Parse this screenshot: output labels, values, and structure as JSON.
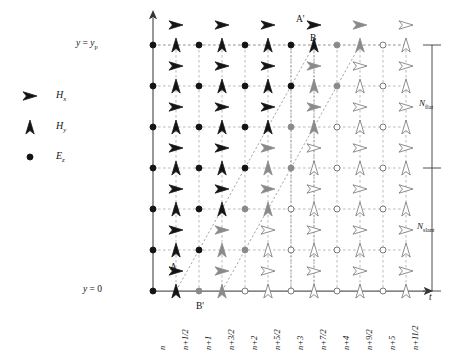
{
  "figure": {
    "axis_y_label": "y",
    "axis_t_label": "t",
    "y_top_label": "y = yₚ",
    "y_top_label_parts": {
      "lhs": "y",
      "eq": "=",
      "rhs": "y",
      "rhs_sub": "p"
    },
    "y_bottom_label": "y = 0",
    "y_bottom_label_parts": {
      "lhs": "y",
      "eq": "=",
      "rhs": "0"
    }
  },
  "legend": {
    "items": [
      {
        "symbol": "right-arrow-black",
        "label": "H",
        "sub": "x",
        "script": true
      },
      {
        "symbol": "up-arrow-black",
        "label": "H",
        "sub": "y",
        "script": true
      },
      {
        "symbol": "filled-dot-black",
        "label": "E",
        "sub": "z",
        "script": true
      }
    ]
  },
  "brackets": {
    "flat": {
      "label": "N",
      "sub": "flat"
    },
    "slant": {
      "label": "N",
      "sub": "slant"
    }
  },
  "point_labels": [
    {
      "name": "A",
      "x": 170,
      "y": 262
    },
    {
      "name": "A'",
      "x": 296,
      "y": 14
    },
    {
      "name": "B",
      "x": 310,
      "y": 33
    },
    {
      "name": "B'",
      "x": 196,
      "y": 301
    }
  ],
  "x_tick_labels": [
    "n",
    "n+1/2",
    "n+1",
    "n+3/2",
    "n+2",
    "n+5/2",
    "n+3",
    "n+7/2",
    "n+4",
    "n+9/2",
    "n+5",
    "n+11/2"
  ],
  "chart_data": {
    "type": "scatter",
    "xlabel": "t",
    "ylabel": "y",
    "x_categories": [
      "n",
      "n+1/2",
      "n+1",
      "n+3/2",
      "n+2",
      "n+5/2",
      "n+3",
      "n+7/2",
      "n+4",
      "n+9/2",
      "n+5",
      "n+11/2"
    ],
    "x_pixels": [
      153,
      176,
      199,
      222,
      245,
      268,
      291,
      314,
      337,
      360,
      383,
      406
    ],
    "row_pixels_Ez": [
      45,
      86,
      127,
      168,
      209,
      250,
      291
    ],
    "row_pixels_Hx": [
      25,
      66,
      107,
      148,
      189,
      230,
      271
    ],
    "shading_levels": [
      "black",
      "gray",
      "white"
    ],
    "colors": {
      "black": "#141414",
      "gray": "#8a8a8a",
      "white": "#ffffff",
      "stroke": "#6b6b6b",
      "axis": "#555555",
      "grid": "#9a9a9a"
    },
    "grid": true,
    "legend_position": "left-outside"
  }
}
